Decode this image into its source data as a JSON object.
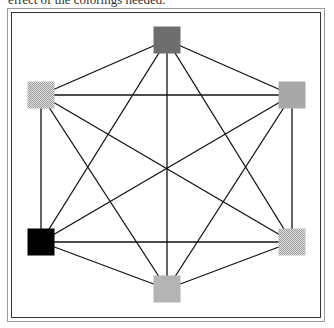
{
  "caption": "effect of the colorings needed.",
  "graph": {
    "type": "complete-graph-K6",
    "nodes": [
      {
        "id": "top",
        "x": 167,
        "y": 40,
        "fill": "#6e6e6e",
        "pattern": "solid"
      },
      {
        "id": "top-right",
        "x": 292,
        "y": 95,
        "fill": "#a8a8a8",
        "pattern": "solid"
      },
      {
        "id": "bottom-right",
        "x": 292,
        "y": 242,
        "fill": "#d0d0d0",
        "pattern": "dither"
      },
      {
        "id": "bottom",
        "x": 167,
        "y": 289,
        "fill": "#b4b4b4",
        "pattern": "solid"
      },
      {
        "id": "bottom-left",
        "x": 41,
        "y": 242,
        "fill": "#000000",
        "pattern": "solid"
      },
      {
        "id": "top-left",
        "x": 41,
        "y": 95,
        "fill": "#c4c4c4",
        "pattern": "dither"
      }
    ],
    "node_size": 27,
    "edge_color": "#111111"
  }
}
